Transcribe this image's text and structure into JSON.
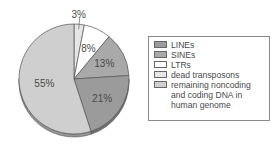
{
  "chart_data": {
    "type": "pie",
    "title": "",
    "categories": [
      "LINEs",
      "SINEs",
      "LTRs",
      "dead transposons",
      "remaining noncoding and coding DNA in human genome"
    ],
    "values": [
      21,
      13,
      8,
      3,
      55
    ],
    "value_labels": [
      "21%",
      "13%",
      "8%",
      "3%",
      "55%"
    ],
    "colors": [
      "#9b9b9b",
      "#a9a9a9",
      "#ffffff",
      "#e6e6e6",
      "#cfcfcf"
    ],
    "order_clockwise_from_top": [
      "dead transposons",
      "LTRs",
      "SINEs",
      "LINEs",
      "remaining noncoding and coding DNA in human genome"
    ],
    "legend_position": "right",
    "style": "3d-tilted"
  },
  "legend": {
    "items": [
      {
        "label": "LINEs",
        "color": "#9b9b9b"
      },
      {
        "label": "SINEs",
        "color": "#a9a9a9"
      },
      {
        "label": "LTRs",
        "color": "#ffffff"
      },
      {
        "label": "dead transposons",
        "color": "#e6e6e6"
      },
      {
        "label": "remaining noncoding\nand coding DNA in\nhuman genome",
        "color": "#cfcfcf"
      }
    ]
  }
}
